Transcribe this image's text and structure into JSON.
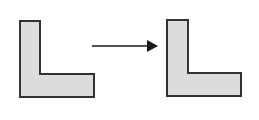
{
  "diagram": {
    "colors": {
      "fill": "#dcdcdc",
      "stroke": "#333333",
      "arrow": "#1a1a1a",
      "background": "#ffffff"
    },
    "shapes": [
      {
        "name": "source-l-shape",
        "points": "20,21 40,21 40,74 94,74 94,97 20,97"
      },
      {
        "name": "target-l-shape",
        "points": "167,20 188,20 188,73 241,73 241,96 167,96"
      }
    ],
    "arrow": {
      "x1": 92,
      "y1": 46,
      "x2": 147,
      "y2": 46,
      "head": "147,40 158,46 147,52"
    }
  }
}
